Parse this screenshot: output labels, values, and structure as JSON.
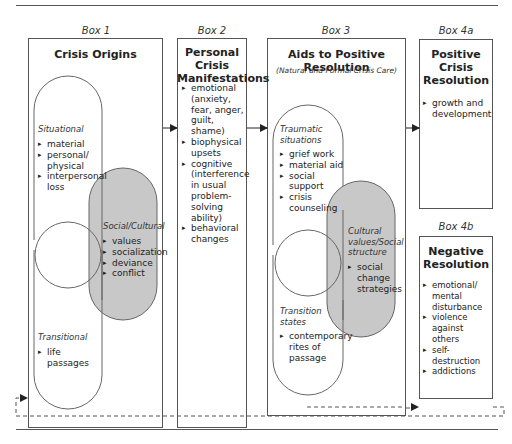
{
  "diagram": {
    "colors": {
      "line": "#555555",
      "shaded": "#c8c8c8",
      "background": "#ffffff"
    },
    "box1": {
      "label": "Box 1",
      "title": "Crisis Origins",
      "situational": {
        "heading": "Situational",
        "items": [
          "material",
          "personal/ physical",
          "interpersonal loss"
        ]
      },
      "social_cultural": {
        "heading": "Social/Cultural",
        "items": [
          "values",
          "socialization",
          "deviance",
          "conflict"
        ]
      },
      "transitional": {
        "heading": "Transitional",
        "items": [
          "life passages"
        ]
      }
    },
    "box2": {
      "label": "Box 2",
      "title_line1": "Personal Crisis",
      "title_line2": "Manifestations",
      "items": [
        "emotional (anxiety, fear, anger, guilt, shame)",
        "biophysical upsets",
        "cognitive (interference in usual problem-solving ability)",
        "behavioral changes"
      ]
    },
    "box3": {
      "label": "Box 3",
      "title": "Aids to Positive Resolution",
      "subtitle": "(Natural and Formal Crisis Care)",
      "traumatic": {
        "heading_line1": "Traumatic",
        "heading_line2": "situations",
        "items": [
          "grief work",
          "material aid",
          "social support",
          "crisis counseling"
        ]
      },
      "cultural": {
        "heading_line1": "Cultural",
        "heading_line2": "values/Social",
        "heading_line3": "structure",
        "items": [
          "social change strategies"
        ]
      },
      "transition": {
        "heading_line1": "Transition",
        "heading_line2": "states",
        "items": [
          "contemporary rites of passage"
        ]
      }
    },
    "box4a": {
      "label": "Box 4a",
      "title_line1": "Positive",
      "title_line2": "Crisis",
      "title_line3": "Resolution",
      "items": [
        "growth and development"
      ]
    },
    "box4b": {
      "label": "Box 4b",
      "title_line1": "Negative",
      "title_line2": "Resolution",
      "items": [
        "emotional/ mental disturbance",
        "violence against others",
        "self-destruction",
        "addictions"
      ]
    }
  }
}
